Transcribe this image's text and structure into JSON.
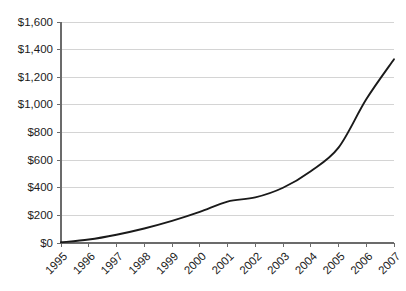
{
  "chart_data": {
    "type": "line",
    "title": "",
    "subtitle": "",
    "xlabel": "",
    "ylabel": "",
    "categories": [
      "1995",
      "1996",
      "1997",
      "1998",
      "1999",
      "2000",
      "2001",
      "2002",
      "2003",
      "2004",
      "2005",
      "2006",
      "2007"
    ],
    "x": [
      1995,
      1996,
      1997,
      1998,
      1999,
      2000,
      2001,
      2002,
      2003,
      2004,
      2005,
      2006,
      2007
    ],
    "values": [
      5,
      25,
      60,
      105,
      160,
      225,
      300,
      330,
      400,
      520,
      690,
      1040,
      1330
    ],
    "series": [
      {
        "name": "",
        "color": "#1a1a1a",
        "values": [
          5,
          25,
          60,
          105,
          160,
          225,
          300,
          330,
          400,
          520,
          690,
          1040,
          1330
        ]
      }
    ],
    "ylim": [
      0,
      1600
    ],
    "ytick_values": [
      0,
      200,
      400,
      600,
      800,
      1000,
      1200,
      1400,
      1600
    ],
    "ytick_labels": [
      "$0",
      "$200",
      "$400",
      "$600",
      "$800",
      "$1,000",
      "$1,200",
      "$1,400",
      "$1,600"
    ],
    "xtick_labels": [
      "1995",
      "1996",
      "1997",
      "1998",
      "1999",
      "2000",
      "2001",
      "2002",
      "2003",
      "2004",
      "2005",
      "2006",
      "2007"
    ],
    "xtick_rotation_deg": -45,
    "grid": {
      "horizontal": true,
      "vertical": false,
      "color": "#d4d4d4"
    },
    "legend": {
      "visible": false,
      "position": "none",
      "entries": []
    },
    "annotations": [],
    "axis_color": "#6b6b6b",
    "background_color": "#ffffff"
  }
}
